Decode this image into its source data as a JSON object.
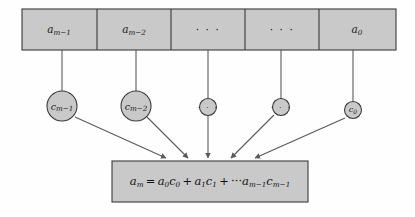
{
  "diagram": {
    "colors": {
      "fill": "#c9c9c9",
      "stroke": "#3a3a3a",
      "line": "#5a5a5a",
      "background": "#fefefe",
      "text": "#1a1a1a"
    },
    "top_row": {
      "name": "coefficient-array",
      "cells": [
        {
          "base": "a",
          "sub": "m−1",
          "display": "a_{m-1}",
          "is_ellipsis": false
        },
        {
          "base": "a",
          "sub": "m−2",
          "display": "a_{m-2}",
          "is_ellipsis": false
        },
        {
          "base": "· · ·",
          "sub": "",
          "display": "· · ·",
          "is_ellipsis": true
        },
        {
          "base": "· · ·",
          "sub": "",
          "display": "· · ·",
          "is_ellipsis": true
        },
        {
          "base": "a",
          "sub": "0",
          "display": "a_0",
          "is_ellipsis": false
        }
      ]
    },
    "circle_row": {
      "name": "multiplier-nodes",
      "nodes": [
        {
          "base": "c",
          "sub": "m−1",
          "display": "c_{m-1}",
          "is_ellipsis": false,
          "size": "big"
        },
        {
          "base": "c",
          "sub": "m−2",
          "display": "c_{m-2}",
          "is_ellipsis": false,
          "size": "big"
        },
        {
          "base": "· · ·",
          "sub": "",
          "display": "· · ·",
          "is_ellipsis": true,
          "size": "small"
        },
        {
          "base": "· · ·",
          "sub": "",
          "display": "· · ·",
          "is_ellipsis": true,
          "size": "small"
        },
        {
          "base": "c",
          "sub": "0",
          "display": "c_0",
          "is_ellipsis": false,
          "size": "small"
        }
      ]
    },
    "result_box": {
      "name": "result-equation",
      "equation_plain": "a_m = a_0 c_0 + a_1 c_1 + ··· a_{m-1} c_{m-1}",
      "parts": [
        {
          "base": "a",
          "sub": "m"
        },
        {
          "op": "="
        },
        {
          "base": "a",
          "sub": "0"
        },
        {
          "base": "c",
          "sub": "0"
        },
        {
          "op": "+"
        },
        {
          "base": "a",
          "sub": "1"
        },
        {
          "base": "c",
          "sub": "1"
        },
        {
          "op": "+"
        },
        {
          "op": "···"
        },
        {
          "base": "a",
          "sub": "m−1"
        },
        {
          "base": "c",
          "sub": "m−1"
        }
      ]
    }
  }
}
